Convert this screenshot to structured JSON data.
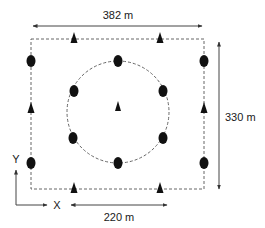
{
  "diagram": {
    "labels": {
      "width_top": "382 m",
      "height_right": "330 m",
      "circle_diameter": "220 m",
      "axis_x": "X",
      "axis_y": "Y"
    },
    "colors": {
      "marker": "#111111",
      "line": "#555555",
      "dashed": "#666666",
      "background": "#ffffff"
    },
    "rectangle": {
      "x1": 31,
      "y1": 39,
      "x2": 204,
      "y2": 189
    },
    "circle": {
      "cx": 118,
      "cy": 112,
      "r": 51
    },
    "ellipse_markers": [
      {
        "name": "rect-top-left",
        "x": 31,
        "y": 61
      },
      {
        "name": "rect-top-right",
        "x": 204,
        "y": 61
      },
      {
        "name": "rect-bottom-left",
        "x": 31,
        "y": 163
      },
      {
        "name": "rect-bottom-right",
        "x": 204,
        "y": 163
      },
      {
        "name": "circle-top",
        "x": 118,
        "y": 61
      },
      {
        "name": "circle-upper-left",
        "x": 74,
        "y": 91
      },
      {
        "name": "circle-upper-right",
        "x": 163,
        "y": 91
      },
      {
        "name": "circle-lower-left",
        "x": 73,
        "y": 138
      },
      {
        "name": "circle-lower-right",
        "x": 163,
        "y": 138
      },
      {
        "name": "circle-bottom",
        "x": 118,
        "y": 163
      }
    ],
    "triangle_markers": [
      {
        "name": "top-left",
        "x": 74,
        "y": 39
      },
      {
        "name": "top-right",
        "x": 160,
        "y": 39
      },
      {
        "name": "bottom-left",
        "x": 74,
        "y": 189
      },
      {
        "name": "bottom-right",
        "x": 160,
        "y": 189
      },
      {
        "name": "left-side",
        "x": 31,
        "y": 108
      },
      {
        "name": "right-side",
        "x": 204,
        "y": 108
      },
      {
        "name": "center",
        "x": 118,
        "y": 107
      }
    ]
  }
}
